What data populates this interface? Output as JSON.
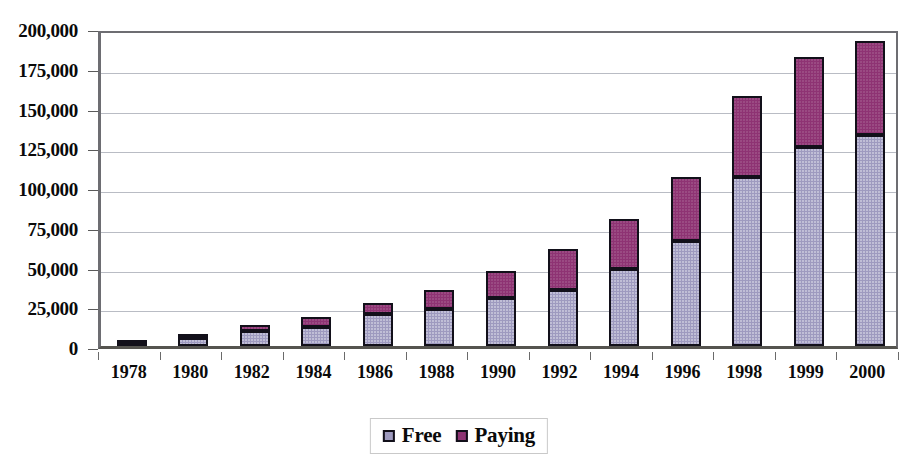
{
  "chart_data": {
    "type": "bar",
    "subtype": "stacked-vertical",
    "title": "",
    "xlabel": "",
    "ylabel": "",
    "ylim": [
      0,
      200000
    ],
    "ytick_values": [
      0,
      25000,
      50000,
      75000,
      100000,
      125000,
      150000,
      175000,
      200000
    ],
    "ytick_labels": [
      "0",
      "25,000",
      "50,000",
      "75,000",
      "100,000",
      "125,000",
      "150,000",
      "175,000",
      "200,000"
    ],
    "grid": true,
    "grid_axis": "y",
    "legend_position": "bottom-center",
    "categories": [
      "1978",
      "1980",
      "1982",
      "1984",
      "1986",
      "1988",
      "1990",
      "1992",
      "1994",
      "1996",
      "1998",
      "1999",
      "2000"
    ],
    "series": [
      {
        "name": "Free",
        "color": "#9e9abf",
        "values": [
          1000,
          5000,
          9500,
          12000,
          20000,
          23000,
          30000,
          35000,
          48500,
          66000,
          106000,
          125000,
          133000
        ]
      },
      {
        "name": "Paying",
        "color": "#8e3373",
        "values": [
          500,
          2000,
          3500,
          6000,
          7000,
          12000,
          17000,
          26000,
          31500,
          40000,
          51000,
          57000,
          59000
        ]
      }
    ],
    "totals": [
      1500,
      7000,
      13000,
      18000,
      27000,
      35000,
      47000,
      61000,
      80000,
      106000,
      157000,
      182000,
      192000
    ]
  },
  "legend": {
    "items": [
      {
        "label": "Free",
        "swatch_icon": "legend-swatch-icon",
        "color": "#9e9abf"
      },
      {
        "label": "Paying",
        "swatch_icon": "legend-swatch-icon",
        "color": "#8e3373"
      }
    ]
  }
}
